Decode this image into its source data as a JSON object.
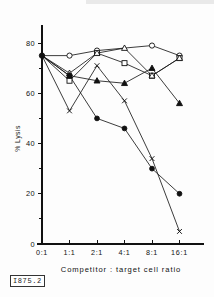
{
  "figure": {
    "stamp_label": "I875.2"
  },
  "chart_data": {
    "type": "line",
    "title": "",
    "xlabel": "Competitor : target cell ratio",
    "ylabel": "% Lysis",
    "categories": [
      "0:1",
      "1:1",
      "2:1",
      "4:1",
      "8:1",
      "16:1"
    ],
    "xtick_labels": [
      "0:1",
      "1:1",
      "2:1",
      "4:1",
      "8:1",
      "16:1"
    ],
    "ytick_labels": [
      "0",
      "20",
      "40",
      "60",
      "80"
    ],
    "ytick_values": [
      0,
      20,
      40,
      60,
      80
    ],
    "ylim": [
      0,
      84
    ],
    "xlim": [
      0,
      5
    ],
    "grid": false,
    "legend_position": "none",
    "series": [
      {
        "name": "open-circle",
        "marker": "open-circle",
        "values": [
          75,
          75,
          77,
          null,
          79,
          75
        ]
      },
      {
        "name": "open-square",
        "marker": "open-square",
        "values": [
          75,
          65,
          76,
          72,
          67,
          74
        ]
      },
      {
        "name": "open-triangle",
        "marker": "open-triangle",
        "values": [
          75,
          68,
          76,
          78,
          67,
          74
        ]
      },
      {
        "name": "filled-triangle",
        "marker": "filled-triangle",
        "values": [
          75,
          67,
          65,
          64,
          70,
          56
        ]
      },
      {
        "name": "filled-circle",
        "marker": "filled-circle",
        "values": [
          75,
          67,
          50,
          46,
          30,
          20
        ]
      },
      {
        "name": "cross-x",
        "marker": "x",
        "values": [
          75,
          53,
          71,
          57,
          34,
          5
        ]
      }
    ]
  }
}
